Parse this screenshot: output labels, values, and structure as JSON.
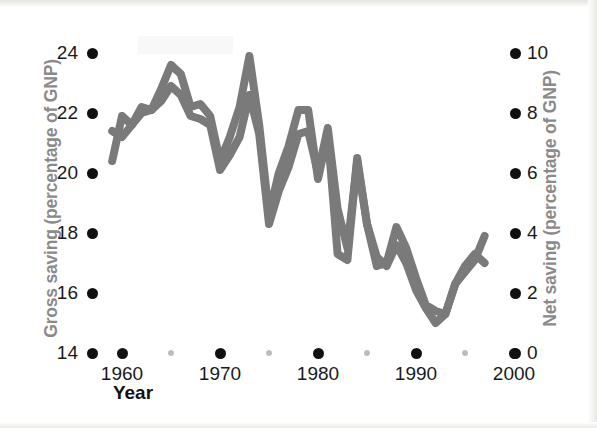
{
  "chart_data": {
    "type": "line",
    "title": "",
    "xlabel": "Year",
    "ylabel": "Gross saving (percentage of GNP)",
    "y2label": "Net saving (percentage of GNP)",
    "xlim": [
      1958,
      2000
    ],
    "ylim": [
      14,
      24
    ],
    "y2lim": [
      0,
      10
    ],
    "grid": false,
    "legend": null,
    "x_ticks": [
      1960,
      1970,
      1980,
      1990,
      2000
    ],
    "x_tick_labels": [
      "1960",
      "1970",
      "1980",
      "1990",
      "2000"
    ],
    "x_minor_ticks": [
      1965,
      1975,
      1985,
      1995
    ],
    "y_ticks": [
      14,
      16,
      18,
      20,
      22,
      24
    ],
    "y_tick_labels": [
      "14",
      "16",
      "18",
      "20",
      "22",
      "24"
    ],
    "y2_ticks": [
      0,
      2,
      4,
      6,
      8,
      10
    ],
    "y2_tick_labels": [
      "0",
      "2",
      "4",
      "6",
      "8",
      "10"
    ],
    "line_color": "#7a7a7a",
    "line_width_px": 8,
    "series": [
      {
        "name": "Gross saving",
        "axis": "left",
        "x": [
          1959,
          1960,
          1961,
          1962,
          1963,
          1964,
          1965,
          1966,
          1967,
          1968,
          1969,
          1970,
          1971,
          1972,
          1973,
          1974,
          1975,
          1976,
          1977,
          1978,
          1979,
          1980,
          1981,
          1982,
          1983,
          1984,
          1985,
          1986,
          1987,
          1988,
          1989,
          1990,
          1991,
          1992,
          1993,
          1994,
          1995,
          1996,
          1997
        ],
        "values": [
          20.4,
          21.9,
          21.6,
          22.0,
          22.1,
          22.4,
          22.9,
          22.6,
          21.9,
          21.8,
          21.6,
          20.1,
          20.6,
          21.2,
          22.6,
          21.3,
          18.3,
          19.4,
          20.2,
          21.3,
          21.4,
          20.0,
          21.5,
          18.8,
          17.5,
          20.4,
          18.3,
          17.2,
          16.9,
          17.6,
          17.0,
          16.1,
          15.5,
          15.0,
          15.3,
          16.3,
          16.7,
          17.1,
          17.9
        ]
      },
      {
        "name": "Net saving",
        "axis": "right",
        "x": [
          1959,
          1960,
          1961,
          1962,
          1963,
          1964,
          1965,
          1966,
          1967,
          1968,
          1969,
          1970,
          1971,
          1972,
          1973,
          1974,
          1975,
          1976,
          1977,
          1978,
          1979,
          1980,
          1981,
          1982,
          1983,
          1984,
          1985,
          1986,
          1987,
          1988,
          1989,
          1990,
          1991,
          1992,
          1993,
          1994,
          1995,
          1996,
          1997
        ],
        "values": [
          7.4,
          7.2,
          7.6,
          8.2,
          8.1,
          8.8,
          9.6,
          9.3,
          8.2,
          8.3,
          7.9,
          6.4,
          7.2,
          8.2,
          9.9,
          7.6,
          4.6,
          6.0,
          6.9,
          8.1,
          8.1,
          5.8,
          7.3,
          3.3,
          3.1,
          6.5,
          4.3,
          2.9,
          3.0,
          4.2,
          3.5,
          2.5,
          1.6,
          1.4,
          1.3,
          2.3,
          2.9,
          3.3,
          3.0
        ]
      }
    ]
  },
  "axes": {
    "left_title": "Gross saving (percentage of GNP)",
    "right_title": "Net saving (percentage of GNP)",
    "x_title": "Year"
  },
  "colors": {
    "line": "#7a7a7a",
    "axis_title": "#8a8a8a",
    "tick_text": "#1a1a1a",
    "tick_dot": "#111111",
    "tick_dot_minor": "#bdbdbd",
    "background": "#ffffff"
  }
}
